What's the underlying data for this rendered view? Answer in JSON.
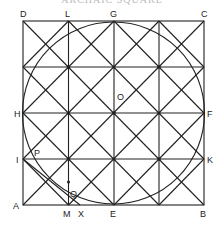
{
  "title": "ARCHAIC SQUARE",
  "colors": {
    "line": "#222222",
    "background": "#ffffff"
  },
  "square": {
    "x0": 23,
    "y0": 21,
    "size": 181,
    "divisions": 4
  },
  "circle": {
    "center_label": "O"
  },
  "labels": {
    "D": "D",
    "L": "L",
    "G": "G",
    "C": "C",
    "H": "H",
    "O": "O",
    "F": "F",
    "I": "I",
    "P": "P",
    "K": "K",
    "Q": "Q",
    "A": "A",
    "M": "M",
    "X": "X",
    "E": "E",
    "B": "B"
  }
}
